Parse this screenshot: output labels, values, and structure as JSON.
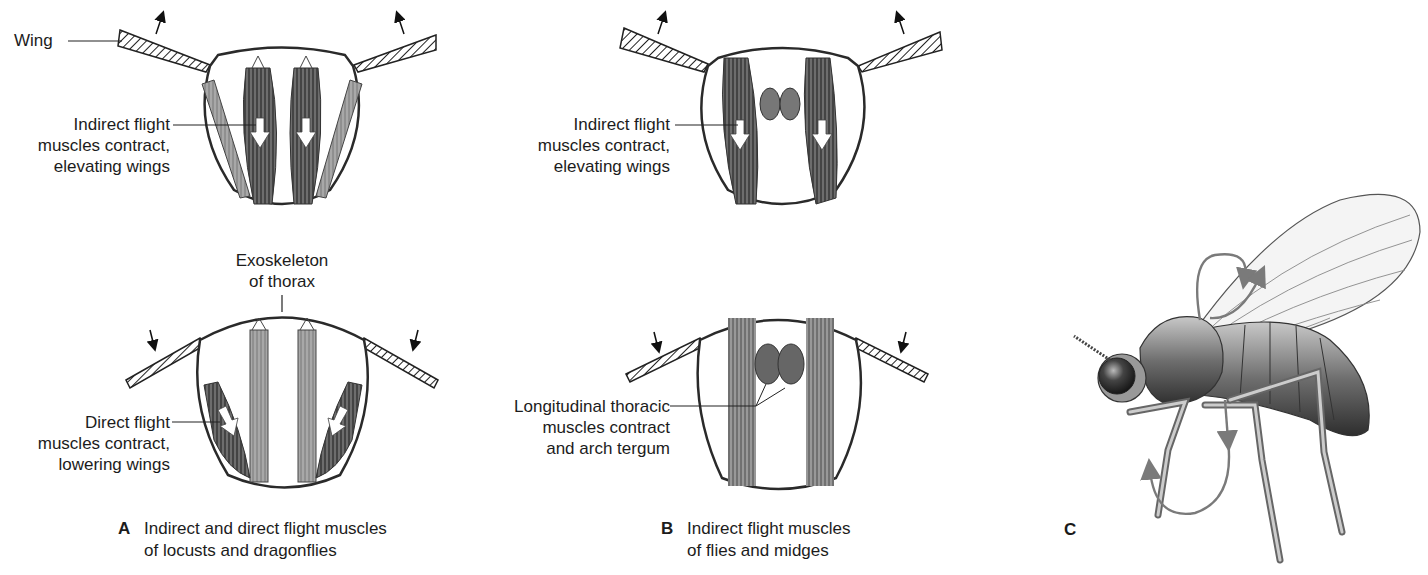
{
  "figure": {
    "panels": [
      {
        "id": "A",
        "letter": "A",
        "caption": [
          "Indirect and direct flight muscles",
          "of locusts and dragonflies"
        ],
        "top_diagram": {
          "state": "wings-elevated",
          "labels": {
            "wing": "Wing",
            "indirect": [
              "Indirect flight",
              "muscles contract,",
              "elevating wings"
            ]
          }
        },
        "bottom_diagram": {
          "state": "wings-lowered",
          "labels": {
            "exoskeleton": [
              "Exoskeleton",
              "of thorax"
            ],
            "direct": [
              "Direct flight",
              "muscles contract,",
              "lowering wings"
            ]
          }
        }
      },
      {
        "id": "B",
        "letter": "B",
        "caption": [
          "Indirect flight muscles",
          "of flies and midges"
        ],
        "top_diagram": {
          "state": "wings-elevated",
          "labels": {
            "indirect": [
              "Indirect flight",
              "muscles contract,",
              "elevating wings"
            ]
          }
        },
        "bottom_diagram": {
          "state": "wings-lowered",
          "labels": {
            "longitudinal": [
              "Longitudinal thoracic",
              "muscles contract",
              "and arch tergum"
            ]
          }
        }
      },
      {
        "id": "C",
        "letter": "C",
        "description": "Fly illustration with wing-beat and leg-motion arrows"
      }
    ],
    "colors": {
      "outline": "#2a2a2a",
      "muscle_dark": "#4a4a4a",
      "muscle_mid": "#8a8a8a",
      "muscle_light": "#b5b5b5",
      "arrow_gray": "#7a7a7a"
    }
  }
}
